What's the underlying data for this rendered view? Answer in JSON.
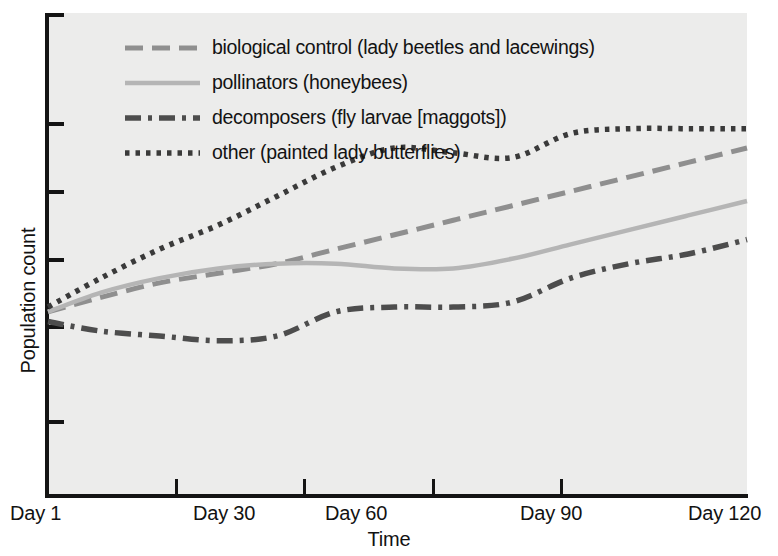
{
  "chart_data": {
    "type": "line",
    "title": "",
    "xlabel": "Time",
    "ylabel": "Population count",
    "grid": false,
    "legend_position": "top-left-inside",
    "x_tick_labels": [
      "Day 1",
      "Day 30",
      "Day 60",
      "Day 90",
      "Day 120"
    ],
    "x_tick_values": [
      1,
      30,
      60,
      90,
      120
    ],
    "y_tick_labels": [
      "",
      "",
      "",
      "",
      "",
      ""
    ],
    "xlim": [
      1,
      120
    ],
    "ylim": [
      0,
      100
    ],
    "y_axis_unlabeled": "true",
    "series": [
      {
        "name": "biological control (lady beetles and lacewings)",
        "short_name": "biological control",
        "line_style": "dashed",
        "color": "#8f8f8f",
        "x": [
          1,
          10,
          20,
          30,
          40,
          50,
          60,
          70,
          80,
          90,
          100,
          110,
          120
        ],
        "values": [
          38,
          41,
          44,
          46,
          48,
          51,
          54,
          57,
          60,
          63,
          66,
          69,
          72
        ]
      },
      {
        "name": "pollinators (honeybees)",
        "short_name": "pollinators",
        "line_style": "solid",
        "color": "#b5b5b5",
        "x": [
          1,
          10,
          20,
          30,
          40,
          50,
          60,
          70,
          80,
          90,
          100,
          110,
          120
        ],
        "values": [
          38,
          42,
          45,
          47,
          48,
          48,
          47,
          47,
          49,
          52,
          55,
          58,
          61
        ]
      },
      {
        "name": "decomposers (fly larvae [maggots])",
        "short_name": "decomposers",
        "line_style": "dash-dot",
        "color": "#4d4d4d",
        "x": [
          1,
          10,
          20,
          30,
          40,
          50,
          60,
          70,
          80,
          90,
          100,
          110,
          120
        ],
        "values": [
          36,
          34,
          33,
          32,
          33,
          38,
          39,
          39,
          40,
          45,
          48,
          50,
          53
        ]
      },
      {
        "name": "other (painted lady butterflies)",
        "short_name": "other",
        "line_style": "dotted",
        "color": "#3a3a3a",
        "x": [
          1,
          10,
          20,
          30,
          40,
          50,
          60,
          70,
          80,
          90,
          100,
          110,
          120
        ],
        "values": [
          39,
          45,
          51,
          56,
          62,
          68,
          72,
          71,
          70,
          75,
          76,
          76,
          76
        ]
      }
    ]
  },
  "axes": {
    "y_title": "Population count",
    "x_title": "Time"
  },
  "legend": {
    "items": [
      {
        "label": "biological control (lady beetles and lacewings)",
        "style": "dashed",
        "color": "#8f8f8f"
      },
      {
        "label": "pollinators (honeybees)",
        "style": "solid",
        "color": "#b5b5b5"
      },
      {
        "label": "decomposers (fly larvae [maggots])",
        "style": "dash-dot",
        "color": "#4d4d4d"
      },
      {
        "label": "other (painted lady butterflies)",
        "style": "dotted",
        "color": "#3a3a3a"
      }
    ]
  },
  "ticks": {
    "x": [
      {
        "label": "Day 1",
        "px": 48
      },
      {
        "label": "Day 30",
        "px": 175
      },
      {
        "label": "Day 60",
        "px": 303
      },
      {
        "label": "Day 90",
        "px": 432
      },
      {
        "label": "Day 120",
        "px": 560
      }
    ],
    "x_label_px": [
      10,
      193,
      325,
      520,
      688
    ],
    "y_px": [
      13,
      122,
      190,
      258,
      325,
      420
    ]
  },
  "colors": {
    "plot_background": "#ececeb",
    "axis": "#141414",
    "text": "#121212",
    "page_background": "#ffffff"
  }
}
